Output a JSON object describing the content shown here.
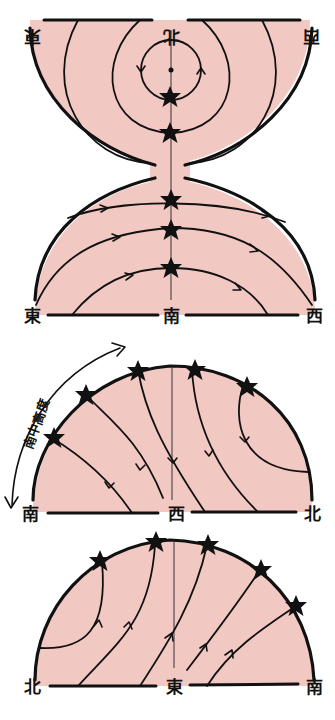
{
  "figure": {
    "colors": {
      "sky_fill": "#f2c8c2",
      "ink": "#111111",
      "background": "#ffffff"
    }
  },
  "panels": [
    {
      "id": "north-south",
      "view": "Northern sky (top, inverted) and southern sky (bottom)",
      "labels": {
        "top_left": "東",
        "top_center": "北",
        "top_right": "西",
        "bottom_left": "東",
        "bottom_center": "南",
        "bottom_right": "西"
      },
      "top_labels_inverted": true,
      "star_count": 5
    },
    {
      "id": "west",
      "view": "Western sky",
      "labels": {
        "left": "南",
        "center": "西",
        "right": "北",
        "arc_annotation": "南中高度"
      },
      "star_count": 5
    },
    {
      "id": "east",
      "view": "Eastern sky",
      "labels": {
        "left": "北",
        "center": "東",
        "right": "南"
      },
      "star_count": 5
    }
  ]
}
